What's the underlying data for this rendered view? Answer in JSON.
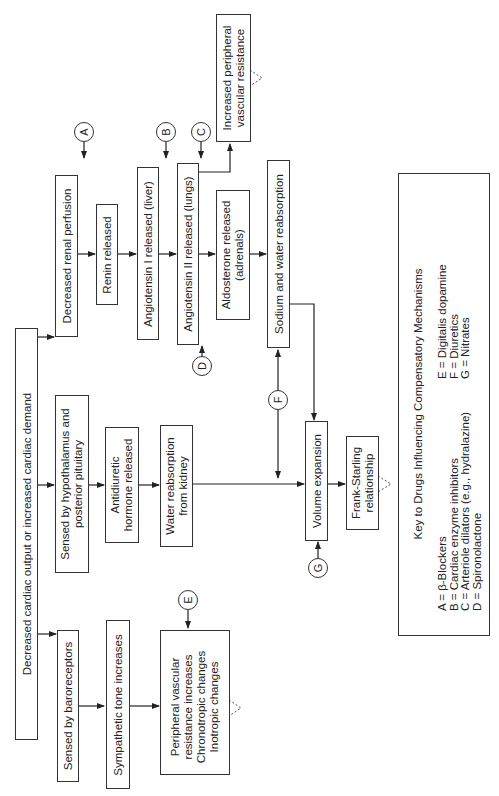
{
  "diagram": {
    "orientation": "rotated-90-ccw",
    "nodes": {
      "start": "Decreased cardiac output or increased cardiac demand",
      "renal_perfusion": "Decreased renal perfusion",
      "renin": "Renin released",
      "angiotensin1": "Angiotensin I released (liver)",
      "angiotensin2": "Angiotensin II released (lungs)",
      "peripheral_resistance_line1": "Increased peripheral",
      "peripheral_resistance_line2": "vascular resistance",
      "aldosterone_line1": "Aldosterone released",
      "aldosterone_line2": "(adrenals)",
      "sodium_water": "Sodium and water reabsorption",
      "hypothalamus_line1": "Sensed by hypothalamus and",
      "hypothalamus_line2": "posterior pituitary",
      "adh_line1": "Antidiuretic",
      "adh_line2": "hormone released",
      "water_reabsorption_line1": "Water reabsorption",
      "water_reabsorption_line2": "from kidney",
      "volume_expansion": "Volume expansion",
      "frank_starling_line1": "Frank-Starling",
      "frank_starling_line2": "relationship",
      "baroreceptors": "Sensed by baroreceptors",
      "sympathetic": "Sympathetic tone increases",
      "effects_line1": "Peripheral vascular",
      "effects_line2": "resistance increases",
      "effects_line3": "Chronotropic changes",
      "effects_line4": "Inotropic changes"
    },
    "drug_markers": [
      "A",
      "B",
      "C",
      "D",
      "E",
      "F",
      "G"
    ],
    "key": {
      "title": "Key to Drugs Influencing Compensatory Mechanisms",
      "left": [
        {
          "letter": "A",
          "eq": "=",
          "drug": "β-Blockers"
        },
        {
          "letter": "B",
          "eq": "=",
          "drug": "Cardiac enzyme inhibitors"
        },
        {
          "letter": "C",
          "eq": "=",
          "drug": "Arteriole dilators (e.g., hydralazine)"
        },
        {
          "letter": "D",
          "eq": "=",
          "drug": "Spironolactone"
        }
      ],
      "right": [
        {
          "letter": "E",
          "eq": "=",
          "drug": "Digitalis dopamine"
        },
        {
          "letter": "F",
          "eq": "=",
          "drug": "Diuretics"
        },
        {
          "letter": "G",
          "eq": "=",
          "drug": "Nitrates"
        }
      ]
    }
  }
}
